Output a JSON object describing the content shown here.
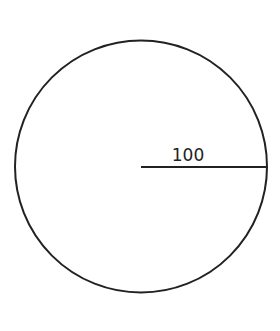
{
  "diagram": {
    "type": "circle-with-radius",
    "circle": {
      "cx": 141,
      "cy": 166.5,
      "r": 126,
      "stroke": "#222222",
      "stroke_width": 2
    },
    "radius_line": {
      "x1": 141,
      "y1": 167,
      "x2": 267,
      "y2": 167,
      "stroke": "#222222"
    },
    "radius_label": "100"
  }
}
